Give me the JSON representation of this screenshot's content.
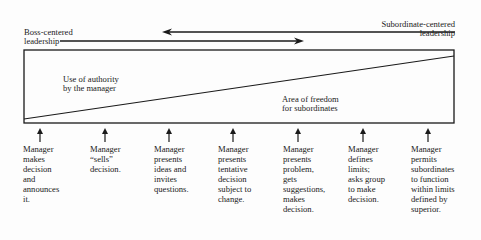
{
  "diagram": {
    "left_label": "Boss-centered\nleadership",
    "right_label": "Subordinate-centered\nleadership",
    "region_top_label": "Use of authority\nby the manager",
    "region_bottom_label": "Area of freedom\nfor subordinates",
    "behaviors": [
      {
        "text": "Manager\nmakes\ndecision\nand\nannounces\nit."
      },
      {
        "text": "Manager\n“sells”\ndecision."
      },
      {
        "text": "Manager\npresents\nideas and\ninvites\nquestions."
      },
      {
        "text": "Manager\npresents\ntentative\ndecision\nsubject to\nchange."
      },
      {
        "text": "Manager\npresents\nproblem,\ngets\nsuggestions,\nmakes\ndecision."
      },
      {
        "text": "Manager\ndefines\nlimits;\nasks group\nto make\ndecision."
      },
      {
        "text": "Manager\npermits\nsubordinates\nto function\nwithin limits\ndefined by\nsuperior."
      }
    ]
  }
}
